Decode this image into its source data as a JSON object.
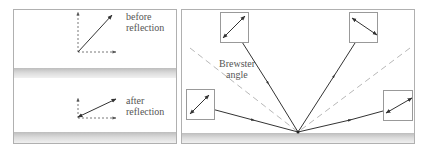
{
  "figure": {
    "left_panel": {
      "top_label_line1": "before",
      "top_label_line2": "reflection",
      "bottom_label_line1": "after",
      "bottom_label_line2": "reflection"
    },
    "right_panel": {
      "brewster_label_line1": "Brewster",
      "brewster_label_line2": "angle"
    }
  },
  "colors": {
    "line": "#333333",
    "border": "#9a9a9a",
    "dashed_guide": "#b8b8b8",
    "surface": "#d8d8d8"
  }
}
